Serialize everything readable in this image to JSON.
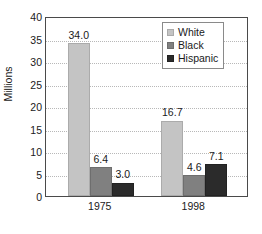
{
  "chart_data": {
    "type": "bar",
    "title": "",
    "subtitle": "",
    "xlabel": "",
    "ylabel": "Millions",
    "categories": [
      "1975",
      "1998"
    ],
    "series": [
      {
        "name": "White",
        "color": "#c4c4c4",
        "values": [
          34.0,
          16.7
        ],
        "labels": [
          "34.0",
          "16.7"
        ]
      },
      {
        "name": "Black",
        "color": "#808080",
        "values": [
          6.4,
          4.6
        ],
        "labels": [
          "6.4",
          "4.6"
        ]
      },
      {
        "name": "Hispanic",
        "color": "#2b2b2b",
        "values": [
          3.0,
          7.1
        ],
        "labels": [
          "3.0",
          "7.1"
        ]
      }
    ],
    "ylim": [
      0,
      40
    ],
    "ytick_step": 5,
    "ytick_labels": [
      "0",
      "5",
      "10",
      "15",
      "20",
      "25",
      "30",
      "35",
      "40"
    ],
    "grid": true,
    "grid_axis": "y",
    "grid_style": "dotted",
    "legend_position": "top-right-inside",
    "legend_entries": [
      "White",
      "Black",
      "Hispanic"
    ],
    "data_labels": true,
    "frame": true
  }
}
